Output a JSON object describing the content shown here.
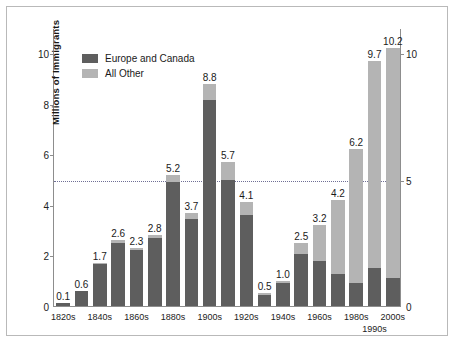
{
  "chart_data": {
    "type": "bar",
    "title": "",
    "xlabel": "",
    "ylabel": "Millions of Immigrants",
    "ylim": [
      0,
      11
    ],
    "yticks": [
      0,
      2,
      4,
      6,
      8,
      10
    ],
    "yticks_right": [
      0,
      5,
      10
    ],
    "grid": false,
    "reference_line": 5,
    "legend_position": "top-left",
    "stacked": true,
    "categories": [
      "1820s",
      "1830s",
      "1840s",
      "1850s",
      "1860s",
      "1870s",
      "1880s",
      "1890s",
      "1900s",
      "1910s",
      "1920s",
      "1930s",
      "1940s",
      "1950s",
      "1960s",
      "1970s",
      "1980s",
      "1990s",
      "2000s"
    ],
    "tick_labels": [
      "1820s",
      "",
      "1840s",
      "",
      "1860s",
      "",
      "1880s",
      "",
      "1900s",
      "",
      "1920s",
      "",
      "1940s",
      "",
      "1960s",
      "",
      "1980s",
      "1990s",
      "2000s"
    ],
    "totals": [
      0.1,
      0.6,
      1.7,
      2.6,
      2.3,
      2.8,
      5.2,
      3.7,
      8.8,
      5.7,
      4.1,
      0.5,
      1.0,
      2.5,
      3.2,
      4.2,
      6.2,
      9.7,
      10.2
    ],
    "series": [
      {
        "name": "Europe and Canada",
        "color": "#5e5e5e",
        "values": [
          0.1,
          0.6,
          1.65,
          2.5,
          2.2,
          2.7,
          4.9,
          3.45,
          8.15,
          5.0,
          3.6,
          0.45,
          0.9,
          2.05,
          1.8,
          1.25,
          0.9,
          1.5,
          1.1
        ]
      },
      {
        "name": "All Other",
        "color": "#b4b4b4",
        "values": [
          0.0,
          0.0,
          0.05,
          0.1,
          0.1,
          0.1,
          0.3,
          0.25,
          0.65,
          0.7,
          0.5,
          0.05,
          0.1,
          0.45,
          1.4,
          2.95,
          5.3,
          8.2,
          9.1
        ]
      }
    ],
    "bar_labels": [
      "0.1",
      "0.6",
      "1.7",
      "2.6",
      "2.3",
      "2.8",
      "5.2",
      "3.7",
      "8.8",
      "5.7",
      "4.1",
      "0.5",
      "1.0",
      "2.5",
      "3.2",
      "4.2",
      "6.2",
      "9.7",
      "10.2"
    ]
  },
  "legend": {
    "items": [
      {
        "label": "Europe and Canada",
        "swatch": "europe-canada-swatch"
      },
      {
        "label": "All Other",
        "swatch": "all-other-swatch"
      }
    ]
  },
  "axes": {
    "y_title": "Millions of Immigrants"
  }
}
